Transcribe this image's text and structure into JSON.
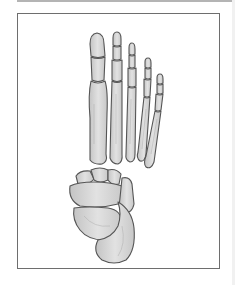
{
  "figure": {
    "colors": {
      "bone_fill": "#d6d6d6",
      "bone_shade": "#bdbdbd",
      "bone_outline": "#555555",
      "frame_border": "#6e6e6e",
      "background": "#ffffff"
    }
  }
}
